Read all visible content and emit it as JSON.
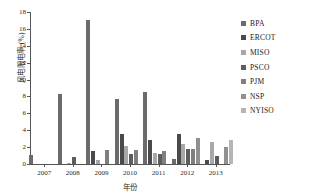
{
  "chart_data": {
    "type": "bar",
    "title": "",
    "subtitle": "",
    "xlabel": "年份",
    "ylabel": "风电限电率 (%)",
    "categories": [
      "2007",
      "2008",
      "2009",
      "2010",
      "2011",
      "2012",
      "2013"
    ],
    "ylim": [
      0,
      18
    ],
    "yticks": [
      0,
      2,
      4,
      6,
      8,
      10,
      12,
      14,
      16,
      18
    ],
    "ytick_labels": [
      "0",
      "2",
      "4",
      "6",
      "8",
      "10",
      "12",
      "14",
      "16",
      "18"
    ],
    "grid": false,
    "legend_position": "right",
    "series": [
      {
        "name": "BPA",
        "color": "#6b6b6b",
        "values": [
          1.1,
          8.3,
          17.1,
          7.7,
          8.5,
          0.6,
          0.0
        ]
      },
      {
        "name": "ERCOT",
        "color": "#4a4a4a",
        "values": [
          0.0,
          0.0,
          1.6,
          3.6,
          2.9,
          3.6,
          0.5
        ]
      },
      {
        "name": "MISO",
        "color": "#a8a8a8",
        "values": [
          0.0,
          0.15,
          0.5,
          2.1,
          1.3,
          2.35,
          2.6
        ]
      },
      {
        "name": "PSCO",
        "color": "#5d5d5d",
        "values": [
          0.0,
          0.85,
          0.0,
          1.2,
          1.2,
          1.8,
          0.9
        ]
      },
      {
        "name": "PJM",
        "color": "#7f7f7f",
        "values": [
          0.0,
          0.0,
          1.65,
          1.65,
          1.55,
          1.8,
          0.0
        ]
      },
      {
        "name": "NSP",
        "color": "#909090",
        "values": [
          0.0,
          0.0,
          0.0,
          0.0,
          0.0,
          3.1,
          2.0
        ]
      },
      {
        "name": "NYISO",
        "color": "#b5b5b5",
        "values": [
          0.0,
          0.0,
          0.0,
          0.0,
          0.0,
          0.0,
          2.9
        ]
      }
    ]
  }
}
